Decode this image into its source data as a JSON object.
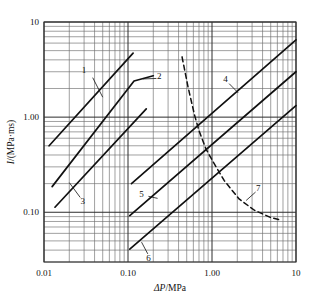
{
  "chart_data": {
    "type": "line",
    "title": "",
    "xlabel": "ΔP/MPa",
    "ylabel": "I/(MPa·ms)",
    "xscale": "log",
    "yscale": "log",
    "xlim": [
      0.01,
      10
    ],
    "ylim": [
      0.03,
      10
    ],
    "grid": true,
    "grid_minor": true,
    "legend": "none",
    "xticks": [
      {
        "value": 0.01,
        "label": "0.01"
      },
      {
        "value": 0.1,
        "label": "0.10"
      },
      {
        "value": 1.0,
        "label": "1.00"
      },
      {
        "value": 10,
        "label": "10"
      }
    ],
    "yticks": [
      {
        "value": 0.1,
        "label": "0.10"
      },
      {
        "value": 1.0,
        "label": "1.00"
      },
      {
        "value": 10,
        "label": "10"
      }
    ],
    "series": [
      {
        "name": "1",
        "label": "1",
        "style": "solid",
        "points": [
          [
            0.0115,
            0.5
          ],
          [
            0.115,
            4.7
          ]
        ],
        "label_pos": [
          0.03,
          3.05
        ],
        "leader": [
          [
            0.038,
            2.6
          ],
          [
            0.05,
            1.62
          ]
        ]
      },
      {
        "name": "2",
        "label": "2",
        "style": "solid",
        "points": [
          [
            0.0125,
            0.186
          ],
          [
            0.118,
            2.4
          ],
          [
            0.2,
            2.72
          ]
        ],
        "label_pos": [
          0.235,
          2.62
        ],
        "leader": [
          [
            0.218,
            2.55
          ],
          [
            0.15,
            2.52
          ]
        ]
      },
      {
        "name": "3",
        "label": "3",
        "style": "solid",
        "points": [
          [
            0.0135,
            0.113
          ],
          [
            0.165,
            1.22
          ]
        ],
        "label_pos": [
          0.029,
          0.128
        ],
        "leader": [
          [
            0.027,
            0.143
          ],
          [
            0.02,
            0.205
          ]
        ]
      },
      {
        "name": "4",
        "label": "4",
        "style": "solid",
        "points": [
          [
            0.11,
            0.2
          ],
          [
            10.0,
            6.5
          ]
        ],
        "label_pos": [
          1.45,
          2.45
        ],
        "leader": [
          [
            1.6,
            2.25
          ],
          [
            2.05,
            1.8
          ]
        ]
      },
      {
        "name": "5",
        "label": "5",
        "style": "solid",
        "points": [
          [
            0.105,
            0.092
          ],
          [
            10.0,
            3.0
          ]
        ],
        "label_pos": [
          0.145,
          0.152
        ],
        "leader": [
          [
            0.175,
            0.147
          ],
          [
            0.225,
            0.14
          ]
        ]
      },
      {
        "name": "6",
        "label": "6",
        "style": "solid",
        "points": [
          [
            0.105,
            0.041
          ],
          [
            10.0,
            1.32
          ]
        ],
        "label_pos": [
          0.175,
          0.0325
        ],
        "leader": [
          [
            0.172,
            0.0365
          ],
          [
            0.145,
            0.0485
          ]
        ]
      },
      {
        "name": "7",
        "label": "7",
        "style": "dashed",
        "points": [
          [
            0.44,
            4.3
          ],
          [
            0.52,
            2.05
          ],
          [
            0.62,
            1.05
          ],
          [
            0.7,
            0.72
          ],
          [
            0.85,
            0.46
          ],
          [
            1.05,
            0.33
          ],
          [
            1.4,
            0.215
          ],
          [
            2.1,
            0.138
          ],
          [
            3.2,
            0.105
          ],
          [
            5.0,
            0.088
          ],
          [
            6.8,
            0.082
          ]
        ],
        "label_pos": [
          3.55,
          0.175
        ],
        "leader": [
          [
            3.3,
            0.163
          ],
          [
            2.55,
            0.133
          ]
        ]
      }
    ]
  }
}
